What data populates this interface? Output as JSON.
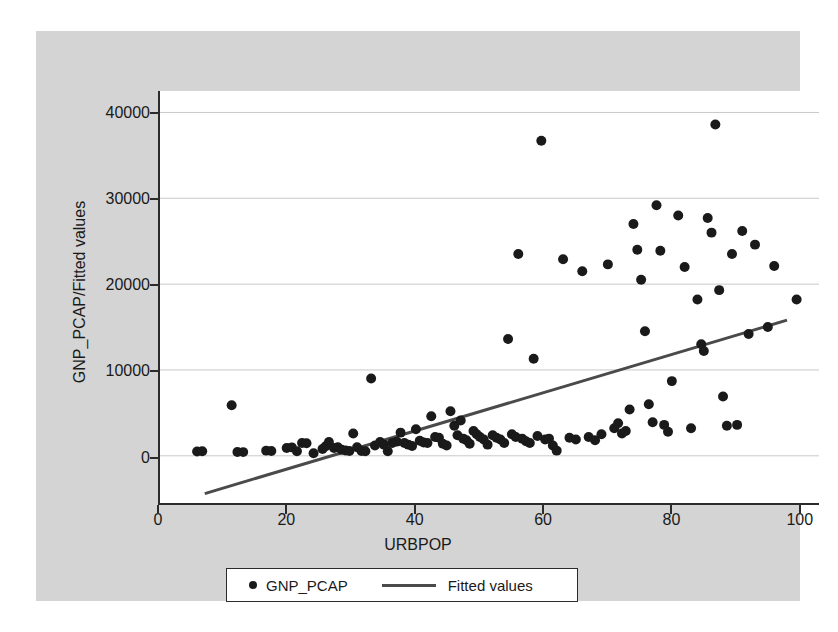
{
  "chart_data": {
    "type": "scatter",
    "title": "",
    "xlabel": "URBPOP",
    "ylabel": "GNP_PCAP/Fitted values",
    "xlim": [
      0,
      103
    ],
    "ylim": [
      -5500,
      42500
    ],
    "xticks": [
      0,
      20,
      40,
      60,
      80,
      100
    ],
    "yticks": [
      0,
      10000,
      20000,
      30000,
      40000
    ],
    "grid": "horizontal",
    "legend_position": "bottom-center",
    "legend": [
      {
        "label": "GNP_PCAP",
        "marker": "dot",
        "color": "#1a1a1a"
      },
      {
        "label": "Fitted values",
        "marker": "line",
        "color": "#4a4a4a"
      }
    ],
    "series": [
      {
        "name": "GNP_PCAP",
        "type": "scatter",
        "marker": "filled-circle",
        "color": "#1a1a1a",
        "points": [
          [
            5.8,
            500
          ],
          [
            6.6,
            520
          ],
          [
            11.2,
            5900
          ],
          [
            12.1,
            450
          ],
          [
            13.0,
            430
          ],
          [
            16.6,
            600
          ],
          [
            17.4,
            560
          ],
          [
            19.8,
            900
          ],
          [
            20.6,
            980
          ],
          [
            21.4,
            520
          ],
          [
            22.2,
            1500
          ],
          [
            22.9,
            1450
          ],
          [
            24.0,
            300
          ],
          [
            25.4,
            800
          ],
          [
            25.9,
            1100
          ],
          [
            26.4,
            1600
          ],
          [
            27.2,
            900
          ],
          [
            27.8,
            1000
          ],
          [
            28.4,
            700
          ],
          [
            29.0,
            620
          ],
          [
            29.6,
            560
          ],
          [
            30.2,
            2600
          ],
          [
            30.8,
            1000
          ],
          [
            31.5,
            560
          ],
          [
            32.1,
            520
          ],
          [
            33.0,
            9000
          ],
          [
            33.6,
            1200
          ],
          [
            34.4,
            1600
          ],
          [
            35.0,
            1300
          ],
          [
            35.6,
            520
          ],
          [
            36.3,
            1500
          ],
          [
            37.0,
            1650
          ],
          [
            37.6,
            2700
          ],
          [
            38.2,
            1500
          ],
          [
            38.8,
            1300
          ],
          [
            39.4,
            1150
          ],
          [
            40.0,
            3100
          ],
          [
            40.6,
            1750
          ],
          [
            41.2,
            1550
          ],
          [
            41.8,
            1500
          ],
          [
            42.4,
            4600
          ],
          [
            43.0,
            2200
          ],
          [
            43.6,
            2100
          ],
          [
            44.2,
            1400
          ],
          [
            44.8,
            1200
          ],
          [
            45.4,
            5200
          ],
          [
            46.0,
            3500
          ],
          [
            46.5,
            2400
          ],
          [
            47.0,
            4100
          ],
          [
            47.4,
            2000
          ],
          [
            47.9,
            1800
          ],
          [
            48.4,
            1400
          ],
          [
            49.0,
            2900
          ],
          [
            49.5,
            2500
          ],
          [
            50.0,
            2200
          ],
          [
            50.6,
            1900
          ],
          [
            51.2,
            1300
          ],
          [
            52.0,
            2400
          ],
          [
            52.6,
            2100
          ],
          [
            53.2,
            1900
          ],
          [
            53.8,
            1500
          ],
          [
            54.4,
            13600
          ],
          [
            55.0,
            2500
          ],
          [
            55.6,
            2200
          ],
          [
            56.0,
            23500
          ],
          [
            56.6,
            2000
          ],
          [
            57.2,
            1700
          ],
          [
            57.8,
            1500
          ],
          [
            58.4,
            11300
          ],
          [
            59.0,
            2300
          ],
          [
            59.6,
            36700
          ],
          [
            60.2,
            1900
          ],
          [
            60.8,
            2000
          ],
          [
            61.4,
            1200
          ],
          [
            62.0,
            600
          ],
          [
            63.0,
            22900
          ],
          [
            64.0,
            2100
          ],
          [
            65.0,
            1900
          ],
          [
            66.0,
            21500
          ],
          [
            67.0,
            2200
          ],
          [
            68.0,
            1800
          ],
          [
            69.0,
            2500
          ],
          [
            70.0,
            22300
          ],
          [
            71.0,
            3200
          ],
          [
            71.6,
            3800
          ],
          [
            72.2,
            2600
          ],
          [
            72.8,
            2900
          ],
          [
            73.4,
            5400
          ],
          [
            74.0,
            27000
          ],
          [
            74.6,
            24000
          ],
          [
            75.2,
            20500
          ],
          [
            75.8,
            14500
          ],
          [
            76.4,
            6000
          ],
          [
            77.0,
            3900
          ],
          [
            77.6,
            29200
          ],
          [
            78.2,
            23900
          ],
          [
            78.8,
            3600
          ],
          [
            79.4,
            2800
          ],
          [
            80.0,
            8700
          ],
          [
            81.0,
            28000
          ],
          [
            82.0,
            22000
          ],
          [
            83.0,
            3200
          ],
          [
            84.0,
            18200
          ],
          [
            84.6,
            13000
          ],
          [
            85.0,
            12200
          ],
          [
            85.6,
            27700
          ],
          [
            86.2,
            26000
          ],
          [
            86.8,
            38600
          ],
          [
            87.4,
            19300
          ],
          [
            88.0,
            6900
          ],
          [
            88.6,
            3500
          ],
          [
            89.4,
            23500
          ],
          [
            90.2,
            3600
          ],
          [
            91.0,
            26200
          ],
          [
            92.0,
            14200
          ],
          [
            93.0,
            24600
          ],
          [
            95.0,
            15000
          ],
          [
            96.0,
            22100
          ],
          [
            99.5,
            18200
          ]
        ]
      },
      {
        "name": "Fitted values",
        "type": "line",
        "color": "#4a4a4a",
        "points": [
          [
            7.0,
            -4400
          ],
          [
            98.0,
            15800
          ]
        ]
      }
    ]
  }
}
